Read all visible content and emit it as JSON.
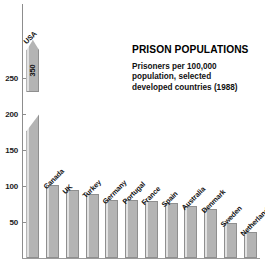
{
  "chart_data": {
    "type": "bar",
    "title": "PRISON POPULATIONS",
    "subtitle": "Prisoners per 100,000 population, selected developed countries (1988)",
    "subtitle_lines": [
      "Prisoners per 100,000",
      "population, selected",
      "developed countries (1988)"
    ],
    "xlabel": "",
    "ylabel": "",
    "ylim": [
      0,
      260
    ],
    "grid": false,
    "legend": "none",
    "yticks": [
      50,
      100,
      150,
      200,
      250
    ],
    "ytick_labels": [
      "50",
      "100",
      "150",
      "200",
      "250"
    ],
    "axis_note": "USA bar is broken/truncated with an arrow top; its value is printed inside the bar because it exceeds the axis maximum.",
    "categories": [
      "USA",
      "Canada",
      "UK",
      "Turkey",
      "Germany",
      "Portugal",
      "France",
      "Spain",
      "Australia",
      "Denmark",
      "Sweden",
      "Netherlands"
    ],
    "values": [
      350,
      101,
      94,
      89,
      81,
      80,
      79,
      76,
      72,
      68,
      48,
      36
    ],
    "value_labels": [
      "350",
      "",
      "",
      "",
      "",
      "",
      "",
      "",
      "",
      "",
      "",
      ""
    ],
    "broken_bar_index": 0
  },
  "axis": {
    "ticks": [
      {
        "label": "250",
        "value": 250
      },
      {
        "label": "200",
        "value": 200
      },
      {
        "label": "150",
        "value": 150
      },
      {
        "label": "100",
        "value": 100
      },
      {
        "label": "50",
        "value": 50
      }
    ]
  },
  "bars": [
    {
      "name": "USA",
      "value": 350,
      "label": "USA",
      "value_label": "350"
    },
    {
      "name": "Canada",
      "value": 101,
      "label": "Canada",
      "value_label": ""
    },
    {
      "name": "UK",
      "value": 94,
      "label": "UK",
      "value_label": ""
    },
    {
      "name": "Turkey",
      "value": 89,
      "label": "Turkey",
      "value_label": ""
    },
    {
      "name": "Germany",
      "value": 81,
      "label": "Germany",
      "value_label": ""
    },
    {
      "name": "Portugal",
      "value": 80,
      "label": "Portugal",
      "value_label": ""
    },
    {
      "name": "France",
      "value": 79,
      "label": "France",
      "value_label": ""
    },
    {
      "name": "Spain",
      "value": 76,
      "label": "Spain",
      "value_label": ""
    },
    {
      "name": "Australia",
      "value": 72,
      "label": "Australia",
      "value_label": ""
    },
    {
      "name": "Denmark",
      "value": 68,
      "label": "Denmark",
      "value_label": ""
    },
    {
      "name": "Sweden",
      "value": 48,
      "label": "Sweden",
      "value_label": ""
    },
    {
      "name": "Netherlands",
      "value": 36,
      "label": "Netherlands",
      "value_label": ""
    }
  ],
  "colors": {
    "bar_fill": "#b4b4b4",
    "bar_highlight": "#e2e2e2",
    "bar_border": "#8f8f8f",
    "axis": "#8d8d8d",
    "text": "#111111"
  }
}
